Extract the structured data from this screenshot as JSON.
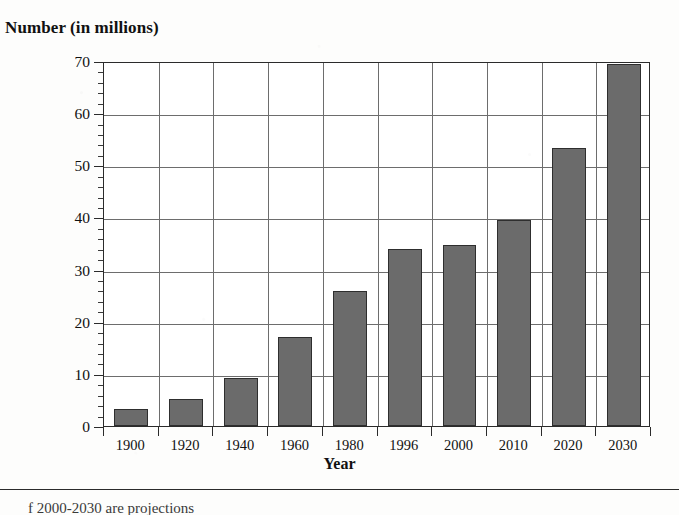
{
  "chart_data": {
    "type": "bar",
    "title": "Number (in millions)",
    "xlabel": "Year",
    "ylabel": "",
    "categories": [
      "1900",
      "1920",
      "1940",
      "1960",
      "1980",
      "1996",
      "2000",
      "2010",
      "2020",
      "2030"
    ],
    "values": [
      3.2,
      5.1,
      9.2,
      17.0,
      25.9,
      34.0,
      34.8,
      39.5,
      53.3,
      69.5
    ],
    "ylim": [
      0,
      70
    ],
    "ytick_labels": [
      "0",
      "10",
      "20",
      "30",
      "40",
      "50",
      "60",
      "70"
    ],
    "ytick_values": [
      0,
      10,
      20,
      30,
      40,
      50,
      60,
      70
    ],
    "minor_tick_step": 2,
    "grid": "both",
    "legend": "none",
    "bar_color": "#6b6b6b",
    "bar_border_color": "#2e2e2e",
    "axis_color": "#2b2b2b",
    "grid_color": "#6d6d6d"
  },
  "footer": {
    "caption": "f   2000-2030 are projections"
  }
}
